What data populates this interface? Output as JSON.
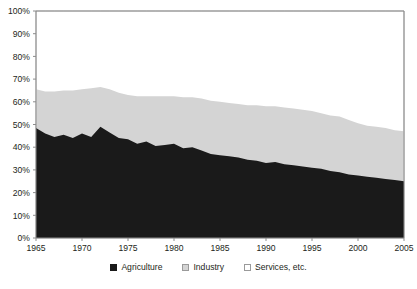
{
  "chart_data": {
    "type": "area",
    "stacked": true,
    "stack_total": 100,
    "title": "",
    "subtitle": "",
    "xlabel": "",
    "ylabel": "",
    "xlim": [
      1965,
      2005
    ],
    "ylim": [
      0,
      100
    ],
    "grid": false,
    "legend_position": "bottom",
    "x_tick_labels": [
      "1965",
      "1970",
      "1975",
      "1980",
      "1985",
      "1990",
      "1995",
      "2000",
      "2005"
    ],
    "x_ticks": [
      1965,
      1970,
      1975,
      1980,
      1985,
      1990,
      1995,
      2000,
      2005
    ],
    "y_tick_labels": [
      "0%",
      "10%",
      "20%",
      "30%",
      "40%",
      "50%",
      "60%",
      "70%",
      "80%",
      "90%",
      "100%"
    ],
    "y_ticks": [
      0,
      10,
      20,
      30,
      40,
      50,
      60,
      70,
      80,
      90,
      100
    ],
    "x": [
      1965,
      1966,
      1967,
      1968,
      1969,
      1970,
      1971,
      1972,
      1973,
      1974,
      1975,
      1976,
      1977,
      1978,
      1979,
      1980,
      1981,
      1982,
      1983,
      1984,
      1985,
      1986,
      1987,
      1988,
      1989,
      1990,
      1991,
      1992,
      1993,
      1994,
      1995,
      1996,
      1997,
      1998,
      1999,
      2000,
      2001,
      2002,
      2003,
      2004,
      2005
    ],
    "series": [
      {
        "name": "Agriculture",
        "color": "#1a1a1a",
        "values": [
          48.5,
          46.0,
          44.5,
          45.5,
          44.0,
          46.0,
          44.5,
          49.0,
          46.5,
          44.0,
          43.5,
          41.5,
          42.5,
          40.5,
          41.0,
          41.5,
          39.5,
          40.0,
          38.5,
          37.0,
          36.5,
          36.0,
          35.5,
          34.5,
          34.0,
          33.0,
          33.5,
          32.5,
          32.0,
          31.5,
          31.0,
          30.5,
          29.5,
          29.0,
          28.0,
          27.5,
          27.0,
          26.5,
          26.0,
          25.5,
          25.0
        ]
      },
      {
        "name": "Industry",
        "color": "#d4d4d4",
        "values": [
          17.0,
          18.5,
          20.0,
          19.5,
          21.0,
          19.5,
          21.5,
          17.5,
          19.0,
          20.0,
          19.5,
          21.0,
          20.0,
          22.0,
          21.5,
          21.0,
          22.5,
          22.0,
          23.0,
          23.5,
          23.5,
          23.5,
          23.5,
          24.0,
          24.5,
          25.0,
          24.5,
          25.0,
          25.0,
          25.0,
          25.0,
          24.5,
          24.5,
          24.5,
          24.0,
          23.0,
          22.5,
          22.5,
          22.5,
          22.0,
          22.0
        ]
      },
      {
        "name": "Services, etc.",
        "color": "#ffffff",
        "values": [
          34.5,
          35.5,
          35.5,
          35.0,
          35.0,
          34.5,
          34.0,
          33.5,
          34.5,
          36.0,
          37.0,
          37.5,
          37.5,
          37.5,
          37.5,
          37.5,
          38.0,
          38.0,
          38.5,
          39.5,
          40.0,
          40.5,
          41.0,
          41.5,
          41.5,
          42.0,
          42.0,
          42.5,
          43.0,
          43.5,
          44.0,
          45.0,
          46.0,
          46.5,
          48.0,
          49.5,
          50.5,
          51.0,
          51.5,
          52.5,
          53.0
        ]
      }
    ],
    "cumulative_top_boundaries": {
      "agriculture_top": [
        48.5,
        46.0,
        44.5,
        45.5,
        44.0,
        46.0,
        44.5,
        49.0,
        46.5,
        44.0,
        43.5,
        41.5,
        42.5,
        40.5,
        41.0,
        41.5,
        39.5,
        40.0,
        38.5,
        37.0,
        36.5,
        36.0,
        35.5,
        34.5,
        34.0,
        33.0,
        33.5,
        32.5,
        32.0,
        31.5,
        31.0,
        30.5,
        29.5,
        29.0,
        28.0,
        27.5,
        27.0,
        26.5,
        26.0,
        25.5,
        25.0
      ],
      "industry_top": [
        65.5,
        64.5,
        64.5,
        65.0,
        65.0,
        65.5,
        66.0,
        66.5,
        65.5,
        64.0,
        63.0,
        62.5,
        62.5,
        62.5,
        62.5,
        62.5,
        62.0,
        62.0,
        61.5,
        60.5,
        60.0,
        59.5,
        59.0,
        58.5,
        58.5,
        58.0,
        58.0,
        57.5,
        57.0,
        56.5,
        56.0,
        55.0,
        54.0,
        53.5,
        52.0,
        50.5,
        49.5,
        49.0,
        48.5,
        47.5,
        47.0
      ]
    }
  },
  "legend": {
    "items": [
      {
        "label": "Agriculture",
        "color": "#1a1a1a",
        "border": "#1a1a1a"
      },
      {
        "label": "Industry",
        "color": "#d4d4d4",
        "border": "#9a9a9a"
      },
      {
        "label": "Services, etc.",
        "color": "#ffffff",
        "border": "#9a9a9a"
      }
    ]
  },
  "axes": {
    "axis_color": "#8c8c8c",
    "tick_color": "#8c8c8c",
    "label_color": "#231f20"
  }
}
